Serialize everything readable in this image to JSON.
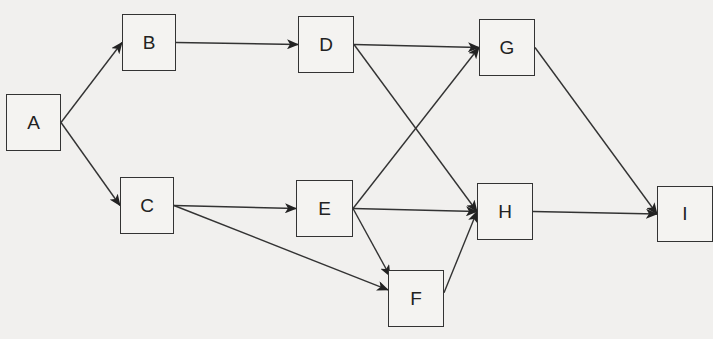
{
  "diagram": {
    "type": "directed-network",
    "nodes": [
      {
        "id": "A",
        "label": "A",
        "x": 6,
        "y": 94,
        "w": 55,
        "h": 57
      },
      {
        "id": "B",
        "label": "B",
        "x": 122,
        "y": 14,
        "w": 54,
        "h": 57
      },
      {
        "id": "C",
        "label": "C",
        "x": 120,
        "y": 177,
        "w": 54,
        "h": 57
      },
      {
        "id": "D",
        "label": "D",
        "x": 298,
        "y": 16,
        "w": 56,
        "h": 57
      },
      {
        "id": "E",
        "label": "E",
        "x": 296,
        "y": 180,
        "w": 57,
        "h": 57
      },
      {
        "id": "F",
        "label": "F",
        "x": 388,
        "y": 270,
        "w": 56,
        "h": 57
      },
      {
        "id": "G",
        "label": "G",
        "x": 479,
        "y": 19,
        "w": 56,
        "h": 57
      },
      {
        "id": "H",
        "label": "H",
        "x": 477,
        "y": 183,
        "w": 56,
        "h": 57
      },
      {
        "id": "I",
        "label": "I",
        "x": 657,
        "y": 186,
        "w": 56,
        "h": 56
      }
    ],
    "edges": [
      {
        "from": "A",
        "to": "B"
      },
      {
        "from": "A",
        "to": "C"
      },
      {
        "from": "B",
        "to": "D"
      },
      {
        "from": "C",
        "to": "E"
      },
      {
        "from": "C",
        "to": "F"
      },
      {
        "from": "D",
        "to": "G"
      },
      {
        "from": "D",
        "to": "H"
      },
      {
        "from": "E",
        "to": "G"
      },
      {
        "from": "E",
        "to": "H"
      },
      {
        "from": "E",
        "to": "F"
      },
      {
        "from": "F",
        "to": "H"
      },
      {
        "from": "G",
        "to": "I"
      },
      {
        "from": "H",
        "to": "I"
      }
    ],
    "colors": {
      "line": "#333333",
      "background": "#f1f0ee"
    }
  }
}
